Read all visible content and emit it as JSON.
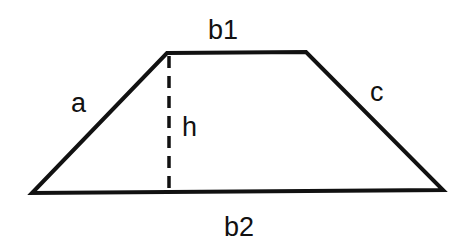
{
  "diagram": {
    "type": "trapezoid",
    "stroke_color": "#111111",
    "background_color": "#ffffff",
    "vertices": {
      "top_left": [
        167,
        53
      ],
      "top_right": [
        306,
        52
      ],
      "bottom_right": [
        443,
        190
      ],
      "bottom_left": [
        32,
        193
      ]
    },
    "height_line": {
      "x": 169,
      "y_top": 55,
      "y_bottom": 192,
      "style": "dashed"
    },
    "labels": {
      "top_base": "b1",
      "bottom_base": "b2",
      "left_side": "a",
      "right_side": "c",
      "height": "h"
    }
  }
}
